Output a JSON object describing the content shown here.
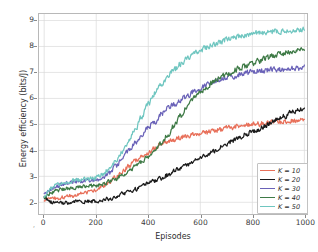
{
  "chart_data": {
    "type": "line",
    "title": "",
    "xlabel": "Episodes",
    "ylabel": "Energy efficiency (bits/J)",
    "xlim": [
      -20,
      1010
    ],
    "ylim": [
      1.55,
      9.25
    ],
    "xticks": [
      0,
      200,
      400,
      600,
      800,
      1000
    ],
    "yticks": [
      2,
      3,
      4,
      5,
      6,
      7,
      8,
      9
    ],
    "grid": true,
    "legend_position": "lower right",
    "x": [
      0,
      25,
      50,
      75,
      100,
      125,
      150,
      175,
      200,
      225,
      250,
      275,
      300,
      325,
      350,
      375,
      400,
      425,
      450,
      475,
      500,
      525,
      550,
      575,
      600,
      625,
      650,
      675,
      700,
      725,
      750,
      775,
      800,
      825,
      850,
      875,
      900,
      925,
      950,
      975,
      1000
    ],
    "series": [
      {
        "name": "K = 10",
        "label": "K = 10",
        "color": "#e8705a",
        "values": [
          2.05,
          2.12,
          2.15,
          2.2,
          2.24,
          2.3,
          2.36,
          2.42,
          2.5,
          2.62,
          2.78,
          2.96,
          3.18,
          3.4,
          3.6,
          3.76,
          3.9,
          4.08,
          4.28,
          4.35,
          4.42,
          4.5,
          4.55,
          4.62,
          4.66,
          4.7,
          4.75,
          4.8,
          4.85,
          4.9,
          4.95,
          4.98,
          5.0,
          5.02,
          5.05,
          5.08,
          5.1,
          5.12,
          5.15,
          5.18,
          5.2
        ]
      },
      {
        "name": "K = 20",
        "label": "K = 20",
        "color": "#1a1a1a",
        "values": [
          2.2,
          2.02,
          1.96,
          1.98,
          2.0,
          2.02,
          2.03,
          2.04,
          2.05,
          2.08,
          2.14,
          2.22,
          2.32,
          2.42,
          2.5,
          2.62,
          2.75,
          2.82,
          2.92,
          3.05,
          3.2,
          3.32,
          3.45,
          3.58,
          3.7,
          3.85,
          3.98,
          4.12,
          4.25,
          4.38,
          4.5,
          4.62,
          4.72,
          4.82,
          4.95,
          5.08,
          5.2,
          5.32,
          5.45,
          5.55,
          5.6
        ]
      },
      {
        "name": "K = 30",
        "label": "K = 30",
        "color": "#6a62b8",
        "values": [
          2.3,
          2.5,
          2.62,
          2.72,
          2.78,
          2.82,
          2.8,
          2.84,
          2.86,
          2.95,
          3.12,
          3.38,
          3.68,
          4.0,
          4.3,
          4.6,
          4.92,
          5.1,
          5.4,
          5.6,
          5.78,
          5.95,
          6.1,
          6.25,
          6.38,
          6.5,
          6.6,
          6.7,
          6.78,
          6.85,
          6.92,
          6.98,
          7.02,
          7.05,
          7.08,
          7.1,
          7.12,
          7.14,
          7.15,
          7.16,
          7.18
        ]
      },
      {
        "name": "K = 40",
        "label": "K = 40",
        "color": "#3e7a46",
        "values": [
          2.18,
          2.35,
          2.45,
          2.52,
          2.56,
          2.58,
          2.6,
          2.62,
          2.65,
          2.7,
          2.78,
          2.9,
          3.05,
          3.2,
          3.38,
          3.55,
          3.75,
          3.98,
          4.25,
          4.6,
          4.95,
          5.35,
          5.7,
          6.0,
          6.25,
          6.45,
          6.62,
          6.78,
          6.92,
          7.05,
          7.15,
          7.25,
          7.35,
          7.45,
          7.55,
          7.62,
          7.7,
          7.75,
          7.8,
          7.84,
          7.86
        ]
      },
      {
        "name": "K = 50",
        "label": "K = 50",
        "color": "#6fc6c0",
        "values": [
          2.25,
          2.52,
          2.68,
          2.76,
          2.82,
          2.86,
          2.88,
          2.9,
          2.95,
          3.08,
          3.3,
          3.6,
          3.95,
          4.35,
          4.8,
          5.3,
          5.8,
          6.2,
          6.55,
          6.85,
          7.1,
          7.35,
          7.55,
          7.7,
          7.85,
          7.98,
          8.08,
          8.18,
          8.26,
          8.34,
          8.4,
          8.45,
          8.5,
          8.52,
          8.55,
          8.57,
          8.58,
          8.6,
          8.61,
          8.63,
          8.65
        ]
      }
    ]
  },
  "axes": {
    "x_tick_labels": [
      "0",
      "200",
      "400",
      "600",
      "800",
      "1000"
    ],
    "y_tick_labels": [
      "2",
      "3",
      "4",
      "5",
      "6",
      "7",
      "8",
      "9"
    ],
    "x_axis_title": "Episodes",
    "y_axis_title": "Energy efficiency (bits/J)",
    "origin_marker": ","
  },
  "legend": {
    "entries": [
      {
        "label": "K = 10",
        "color": "#e8705a"
      },
      {
        "label": "K = 20",
        "color": "#1a1a1a"
      },
      {
        "label": "K = 30",
        "color": "#6a62b8"
      },
      {
        "label": "K = 40",
        "color": "#3e7a46"
      },
      {
        "label": "K = 50",
        "color": "#6fc6c0"
      }
    ]
  },
  "style": {
    "grid_color": "#d9d9d9",
    "axis_color": "#b8b8b8",
    "background": "#ffffff"
  }
}
